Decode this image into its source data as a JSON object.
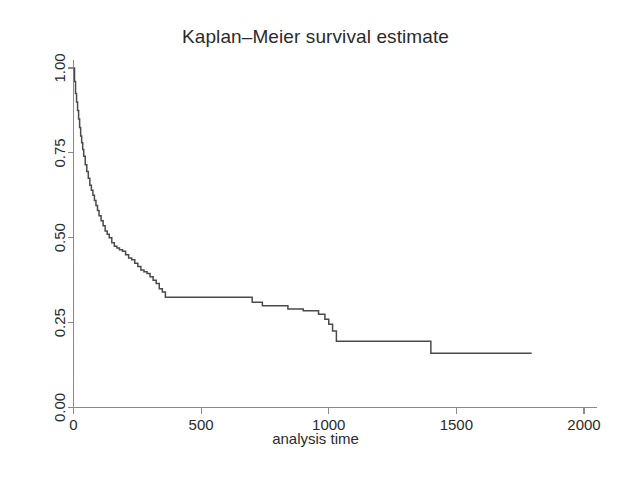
{
  "chart_data": {
    "type": "line",
    "subtype": "step-post",
    "title": "Kaplan–Meier survival estimate",
    "xlabel": "analysis time",
    "ylabel": "",
    "xlim": [
      0,
      2000
    ],
    "ylim": [
      0.0,
      1.0
    ],
    "xticks": [
      0,
      500,
      1000,
      1500,
      2000
    ],
    "xticklabels": [
      "0",
      "500",
      "1000",
      "1500",
      "2000"
    ],
    "yticks": [
      0.0,
      0.25,
      0.5,
      0.75,
      1.0
    ],
    "yticklabels": [
      "0.00",
      "0.25",
      "0.50",
      "0.75",
      "1.00"
    ],
    "grid": false,
    "legend": null,
    "line_color": "#4a4a4a",
    "axis_color": "#8a8a8a",
    "background": "#ffffff",
    "series": [
      {
        "name": "survival",
        "x": [
          0,
          4,
          8,
          12,
          16,
          20,
          24,
          28,
          32,
          36,
          40,
          46,
          52,
          58,
          64,
          70,
          76,
          82,
          88,
          94,
          100,
          108,
          116,
          124,
          132,
          140,
          150,
          160,
          170,
          180,
          192,
          204,
          216,
          228,
          240,
          252,
          264,
          276,
          288,
          300,
          312,
          324,
          336,
          348,
          360,
          640,
          700,
          740,
          790,
          840,
          900,
          960,
          985,
          1000,
          1015,
          1030,
          1380,
          1400,
          1795
        ],
        "y": [
          1.0,
          0.96,
          0.925,
          0.9,
          0.875,
          0.85,
          0.825,
          0.8,
          0.78,
          0.76,
          0.74,
          0.715,
          0.695,
          0.675,
          0.655,
          0.64,
          0.625,
          0.61,
          0.595,
          0.58,
          0.565,
          0.55,
          0.535,
          0.52,
          0.51,
          0.5,
          0.485,
          0.475,
          0.47,
          0.465,
          0.46,
          0.45,
          0.44,
          0.435,
          0.425,
          0.415,
          0.405,
          0.4,
          0.395,
          0.385,
          0.375,
          0.365,
          0.35,
          0.34,
          0.325,
          0.325,
          0.31,
          0.3,
          0.3,
          0.29,
          0.285,
          0.275,
          0.26,
          0.245,
          0.225,
          0.195,
          0.195,
          0.16,
          0.16
        ]
      }
    ]
  }
}
